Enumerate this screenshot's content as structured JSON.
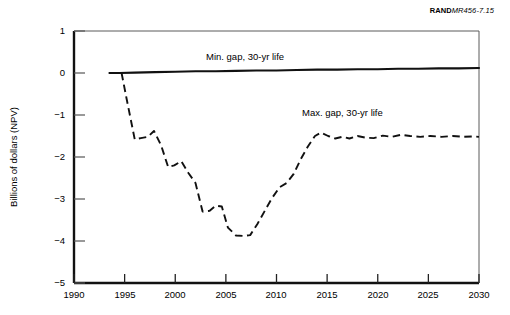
{
  "figure": {
    "source_tag_brand": "RAND",
    "source_tag_code": "MR456-7.15"
  },
  "chart_data": {
    "type": "line",
    "title": "",
    "subtitle": "",
    "xlabel": "",
    "ylabel": "Billions of dollars (NPV)",
    "xlim": [
      1990,
      2030
    ],
    "ylim": [
      -5,
      1
    ],
    "xticks": [
      1990,
      1995,
      2000,
      2005,
      2010,
      2015,
      2020,
      2025,
      2030
    ],
    "yticks": [
      1,
      0,
      -1,
      -2,
      -3,
      -4,
      -5
    ],
    "xtick_labels": [
      "1990",
      "1995",
      "2000",
      "2005",
      "2010",
      "2015",
      "2020",
      "2025",
      "2030"
    ],
    "ytick_labels": [
      "1",
      "0",
      "−1",
      "−2",
      "−3",
      "−4",
      "−5"
    ],
    "grid": false,
    "legend_position": "inline-annotation",
    "series": [
      {
        "name": "Min. gap, 30-yr life",
        "style": "solid",
        "annotation": "Min. gap, 30-yr life",
        "x": [
          1993.5,
          1994.5,
          1996,
          1998,
          2000,
          2002,
          2004,
          2006,
          2008,
          2010,
          2012,
          2014,
          2016,
          2018,
          2020,
          2022,
          2024,
          2026,
          2028,
          2030
        ],
        "values": [
          0.0,
          0.0,
          0.01,
          0.02,
          0.03,
          0.04,
          0.04,
          0.05,
          0.06,
          0.06,
          0.07,
          0.08,
          0.08,
          0.09,
          0.09,
          0.1,
          0.1,
          0.11,
          0.11,
          0.12
        ]
      },
      {
        "name": "Max. gap, 30-yr life",
        "style": "dashed",
        "annotation": "Max. gap, 30-yr life",
        "x": [
          1993.5,
          1994.7,
          1995.2,
          1996.0,
          1996.6,
          1997.3,
          1997.9,
          1998.6,
          1999.3,
          1999.9,
          2000.6,
          2001.3,
          2002.0,
          2002.7,
          2003.4,
          2004.0,
          2004.6,
          2005.2,
          2006.0,
          2006.8,
          2007.4,
          2008.1,
          2008.8,
          2009.5,
          2010.3,
          2011.0,
          2011.7,
          2012.4,
          2013.1,
          2013.8,
          2014.4,
          2015.1,
          2015.8,
          2016.5,
          2017.2,
          2018.0,
          2018.8,
          2019.6,
          2020.5,
          2021.4,
          2022.3,
          2023.2,
          2024.2,
          2025.2,
          2026.3,
          2027.4,
          2028.5,
          2029.5,
          2030.0
        ],
        "values": [
          0.0,
          0.0,
          -0.62,
          -1.58,
          -1.55,
          -1.52,
          -1.38,
          -1.72,
          -2.24,
          -2.2,
          -2.1,
          -2.38,
          -2.62,
          -3.3,
          -3.28,
          -3.16,
          -3.18,
          -3.68,
          -3.87,
          -3.88,
          -3.86,
          -3.6,
          -3.3,
          -3.0,
          -2.72,
          -2.62,
          -2.4,
          -2.05,
          -1.75,
          -1.5,
          -1.42,
          -1.5,
          -1.56,
          -1.52,
          -1.56,
          -1.5,
          -1.54,
          -1.55,
          -1.49,
          -1.52,
          -1.47,
          -1.5,
          -1.52,
          -1.5,
          -1.52,
          -1.5,
          -1.52,
          -1.51,
          -1.52
        ]
      }
    ]
  }
}
